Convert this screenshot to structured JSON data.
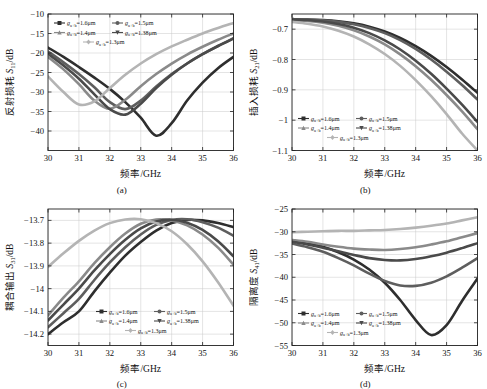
{
  "figure": {
    "panels": [
      "a",
      "b",
      "c",
      "d"
    ],
    "panel_labels": {
      "a": "(a)",
      "b": "(b)",
      "c": "(c)",
      "d": "(d)"
    },
    "xlabel": "频率/GHz",
    "xunit": "GHz",
    "xticks": [
      30,
      31,
      32,
      33,
      34,
      35,
      36
    ],
    "series_colors": [
      "#2e2e2e",
      "#5e5e5e",
      "#8a8a8a",
      "#4a4a4a",
      "#b4b4b4"
    ],
    "legend_labels": [
      {
        "sym": "g",
        "sub": "a+b",
        "eq": "=1.6μm",
        "marker": "square"
      },
      {
        "sym": "g",
        "sub": "a+b",
        "eq": "=1.5μm",
        "marker": "circle"
      },
      {
        "sym": "g",
        "sub": "a+b",
        "eq": "=1.4μm",
        "marker": "triangle-up"
      },
      {
        "sym": "g",
        "sub": "a+b",
        "eq": "=1.38μm",
        "marker": "triangle-down"
      },
      {
        "sym": "g",
        "sub": "a+b",
        "eq": "=1.3μm",
        "marker": "diamond"
      }
    ]
  },
  "chart_data": [
    {
      "type": "line",
      "panel": "a",
      "title": "",
      "xlabel": "频率/GHz",
      "ylabel": "反射损耗 S11/dB",
      "ylabel_cn": "反射损耗",
      "ylabel_sym": "S",
      "ylabel_sub": "11",
      "ylabel_unit": "/dB",
      "xlim": [
        30,
        36
      ],
      "ylim": [
        -45,
        -10
      ],
      "yticks": [
        -10,
        -15,
        -20,
        -25,
        -30,
        -35,
        -40
      ],
      "xticks": [
        30,
        31,
        32,
        33,
        34,
        35,
        36
      ],
      "grid": true,
      "legend_position": "top-left",
      "x": [
        30,
        30.5,
        31,
        31.5,
        32,
        32.5,
        33,
        33.5,
        34,
        34.5,
        35,
        35.5,
        36
      ],
      "series": [
        {
          "name": "g_a+b=1.6μm",
          "values": [
            -18.6,
            -21.0,
            -23.6,
            -26.3,
            -29.2,
            -32.6,
            -36.6,
            -41.2,
            -38.0,
            -32.2,
            -27.6,
            -23.9,
            -21.0
          ]
        },
        {
          "name": "g_a+b=1.5μm",
          "values": [
            -19.6,
            -22.4,
            -25.4,
            -28.8,
            -32.6,
            -34.4,
            -32.2,
            -28.6,
            -25.4,
            -22.7,
            -20.3,
            -18.2,
            -16.2
          ]
        },
        {
          "name": "g_a+b=1.4μm",
          "values": [
            -21.0,
            -24.2,
            -28.0,
            -32.2,
            -34.3,
            -32.0,
            -28.5,
            -25.4,
            -22.7,
            -20.4,
            -18.4,
            -16.6,
            -15.0
          ]
        },
        {
          "name": "g_a+b=1.38μm",
          "values": [
            -20.2,
            -23.2,
            -26.6,
            -30.6,
            -34.4,
            -35.8,
            -33.0,
            -29.0,
            -25.6,
            -22.7,
            -20.3,
            -18.2,
            -16.3
          ]
        },
        {
          "name": "g_a+b=1.3μm",
          "values": [
            -26.0,
            -30.0,
            -33.2,
            -32.4,
            -29.0,
            -25.6,
            -22.7,
            -20.3,
            -18.3,
            -16.6,
            -15.0,
            -13.6,
            -12.3
          ]
        }
      ]
    },
    {
      "type": "line",
      "panel": "b",
      "title": "",
      "xlabel": "频率/GHz",
      "ylabel": "插入损耗 S21/dB",
      "ylabel_cn": "插入损耗",
      "ylabel_sym": "S",
      "ylabel_sub": "21",
      "ylabel_unit": "/dB",
      "xlim": [
        30,
        36
      ],
      "ylim": [
        -1.1,
        -0.65
      ],
      "yticks": [
        -0.7,
        -0.8,
        -0.9,
        -1.0,
        -1.1
      ],
      "xticks": [
        30,
        31,
        32,
        33,
        34,
        35,
        36
      ],
      "grid": true,
      "legend_position": "bottom-left",
      "x": [
        30,
        30.5,
        31,
        31.5,
        32,
        32.5,
        33,
        33.5,
        34,
        34.5,
        35,
        35.5,
        36
      ],
      "series": [
        {
          "name": "g_a+b=1.6μm",
          "values": [
            -0.667,
            -0.668,
            -0.67,
            -0.674,
            -0.681,
            -0.692,
            -0.708,
            -0.729,
            -0.756,
            -0.788,
            -0.825,
            -0.866,
            -0.91
          ]
        },
        {
          "name": "g_a+b=1.5μm",
          "values": [
            -0.667,
            -0.668,
            -0.671,
            -0.676,
            -0.684,
            -0.696,
            -0.713,
            -0.736,
            -0.765,
            -0.8,
            -0.84,
            -0.884,
            -0.932
          ]
        },
        {
          "name": "g_a+b=1.4μm",
          "values": [
            -0.67,
            -0.673,
            -0.679,
            -0.689,
            -0.704,
            -0.724,
            -0.75,
            -0.783,
            -0.822,
            -0.867,
            -0.917,
            -0.971,
            -1.03
          ]
        },
        {
          "name": "g_a+b=1.38μm",
          "values": [
            -0.668,
            -0.67,
            -0.675,
            -0.683,
            -0.695,
            -0.713,
            -0.737,
            -0.767,
            -0.804,
            -0.847,
            -0.896,
            -0.949,
            -1.006
          ]
        },
        {
          "name": "g_a+b=1.3μm",
          "values": [
            -0.676,
            -0.682,
            -0.691,
            -0.705,
            -0.724,
            -0.75,
            -0.782,
            -0.821,
            -0.868,
            -0.921,
            -0.98,
            -1.044,
            -1.1
          ]
        }
      ]
    },
    {
      "type": "line",
      "panel": "c",
      "title": "",
      "xlabel": "频率/GHz",
      "ylabel": "耦合输出 S31/dB",
      "ylabel_cn": "耦合输出",
      "ylabel_sym": "S",
      "ylabel_sub": "31",
      "ylabel_unit": "/dB",
      "xlim": [
        30,
        36
      ],
      "ylim": [
        -14.25,
        -13.65
      ],
      "yticks": [
        -13.7,
        -13.8,
        -13.9,
        -14.0,
        -14.1,
        -14.2
      ],
      "xticks": [
        30,
        31,
        32,
        33,
        34,
        35,
        36
      ],
      "grid": true,
      "legend_position": "bottom-center",
      "x": [
        30,
        30.5,
        31,
        31.5,
        32,
        32.5,
        33,
        33.5,
        34,
        34.5,
        35,
        35.5,
        36
      ],
      "series": [
        {
          "name": "g_a+b=1.6μm",
          "values": [
            -14.2,
            -14.148,
            -14.1,
            -14.012,
            -13.93,
            -13.855,
            -13.795,
            -13.745,
            -13.712,
            -13.698,
            -13.7,
            -13.712,
            -13.73
          ]
        },
        {
          "name": "g_a+b=1.5μm",
          "values": [
            -14.17,
            -14.108,
            -14.045,
            -13.962,
            -13.885,
            -13.818,
            -13.762,
            -13.72,
            -13.698,
            -13.695,
            -13.708,
            -13.732,
            -13.768
          ]
        },
        {
          "name": "g_a+b=1.4μm",
          "values": [
            -14.118,
            -14.04,
            -13.968,
            -13.888,
            -13.818,
            -13.758,
            -13.715,
            -13.696,
            -13.7,
            -13.722,
            -13.762,
            -13.82,
            -13.895
          ]
        },
        {
          "name": "g_a+b=1.38μm",
          "values": [
            -14.14,
            -14.07,
            -14.0,
            -13.92,
            -13.848,
            -13.785,
            -13.735,
            -13.705,
            -13.697,
            -13.71,
            -13.742,
            -13.792,
            -13.858
          ]
        },
        {
          "name": "g_a+b=1.3μm",
          "values": [
            -13.905,
            -13.845,
            -13.79,
            -13.745,
            -13.712,
            -13.696,
            -13.695,
            -13.712,
            -13.748,
            -13.805,
            -13.88,
            -13.972,
            -14.075
          ]
        }
      ]
    },
    {
      "type": "line",
      "panel": "d",
      "title": "",
      "xlabel": "频率/GHz",
      "ylabel": "隔离度 S41/dB",
      "ylabel_cn": "隔离度",
      "ylabel_sym": "S",
      "ylabel_sub": "41",
      "ylabel_unit": "/dB",
      "xlim": [
        30,
        36
      ],
      "ylim": [
        -55,
        -25
      ],
      "yticks": [
        -25,
        -30,
        -35,
        -40,
        -45,
        -50,
        -55
      ],
      "xticks": [
        30,
        31,
        32,
        33,
        34,
        35,
        36
      ],
      "grid": true,
      "legend_position": "bottom-left",
      "x": [
        30,
        30.5,
        31,
        31.5,
        32,
        32.5,
        33,
        33.5,
        34,
        34.5,
        35,
        35.5,
        36
      ],
      "series": [
        {
          "name": "g_a+b=1.6μm",
          "values": [
            -31.9,
            -32.5,
            -33.3,
            -34.5,
            -36.1,
            -38.3,
            -41.2,
            -45.0,
            -49.4,
            -52.7,
            -50.5,
            -45.2,
            -40.3
          ]
        },
        {
          "name": "g_a+b=1.5μm",
          "values": [
            -32.6,
            -33.4,
            -34.4,
            -35.8,
            -37.4,
            -39.2,
            -40.8,
            -41.8,
            -41.9,
            -41.2,
            -39.8,
            -37.9,
            -35.8
          ]
        },
        {
          "name": "g_a+b=1.4μm",
          "values": [
            -31.8,
            -32.2,
            -32.8,
            -33.3,
            -33.7,
            -33.9,
            -34.0,
            -33.8,
            -33.4,
            -32.8,
            -32.1,
            -31.2,
            -30.3
          ]
        },
        {
          "name": "g_a+b=1.38μm",
          "values": [
            -32.2,
            -32.8,
            -33.5,
            -34.3,
            -35.1,
            -35.8,
            -36.2,
            -36.3,
            -36.0,
            -35.4,
            -34.6,
            -33.6,
            -32.5
          ]
        },
        {
          "name": "g_a+b=1.3μm",
          "values": [
            -30.1,
            -30.0,
            -29.9,
            -29.8,
            -29.8,
            -29.7,
            -29.6,
            -29.4,
            -29.1,
            -28.7,
            -28.2,
            -27.5,
            -26.8
          ]
        }
      ]
    }
  ]
}
